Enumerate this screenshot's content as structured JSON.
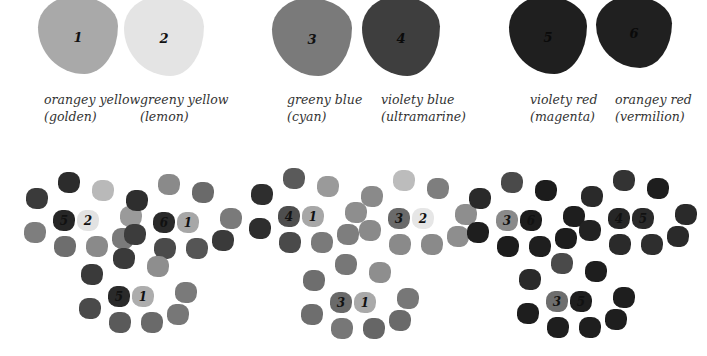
{
  "primaries": [
    {
      "num": "1",
      "name": "orangey yellow",
      "alt": "(golden)",
      "color": "#a9a9a9",
      "x": 38,
      "y": -4,
      "w": 80,
      "h": 78,
      "label_x": 44
    },
    {
      "num": "2",
      "name": "greeny yellow",
      "alt": "(lemon)",
      "color": "#e4e4e4",
      "x": 124,
      "y": -4,
      "w": 80,
      "h": 80,
      "label_x": 140
    },
    {
      "num": "3",
      "name": "greeny  blue",
      "alt": "(cyan)",
      "color": "#7a7a7a",
      "x": 272,
      "y": -2,
      "w": 80,
      "h": 78,
      "label_x": 287
    },
    {
      "num": "4",
      "name": "violety blue",
      "alt": "(ultramarine)",
      "color": "#3e3e3e",
      "x": 362,
      "y": -4,
      "w": 78,
      "h": 80,
      "label_x": 381
    },
    {
      "num": "5",
      "name": "violety red",
      "alt": "(magenta)",
      "color": "#1f1f1f",
      "x": 509,
      "y": -4,
      "w": 78,
      "h": 78,
      "label_x": 530
    },
    {
      "num": "6",
      "name": "orangey  red",
      "alt": "(vermilion)",
      "color": "#202020",
      "x": 596,
      "y": -4,
      "w": 76,
      "h": 72,
      "label_x": 615
    }
  ],
  "mixes": [
    {
      "id": "5-2",
      "cx": 75,
      "cy": 220,
      "a": "5",
      "b": "2",
      "a_color": "#262626",
      "b_color": "#e2e2e2",
      "ring": [
        "#3a3a3a",
        "#2c2c2c",
        "#b9b9b9",
        "#9a9a9a",
        "#7e7e7e",
        "#6e6e6e",
        "#8a8a8a",
        "#7a7a7a"
      ]
    },
    {
      "id": "6-1",
      "cx": 175,
      "cy": 222,
      "a": "6",
      "b": "1",
      "a_color": "#2a2a2a",
      "b_color": "#a7a7a7",
      "ring": [
        "#2e2e2e",
        "#8a8a8a",
        "#6a6a6a",
        "#7a7a7a",
        "#3c3c3c",
        "#4a4a4a",
        "#555555",
        "#3a3a3a"
      ]
    },
    {
      "id": "5-1",
      "cx": 130,
      "cy": 296,
      "a": "5",
      "b": "1",
      "a_color": "#2a2a2a",
      "b_color": "#adadad",
      "ring": [
        "#3a3a3a",
        "#3a3a3a",
        "#8e8e8e",
        "#7a7a7a",
        "#4a4a4a",
        "#5a5a5a",
        "#6a6a6a",
        "#777777"
      ]
    },
    {
      "id": "4-1",
      "cx": 300,
      "cy": 216,
      "a": "4",
      "b": "1",
      "a_color": "#4e4e4e",
      "b_color": "#a7a7a7",
      "ring": [
        "#2e2e2e",
        "#5a5a5a",
        "#9a9a9a",
        "#8e8e8e",
        "#2e2e2e",
        "#4a4a4a",
        "#7a7a7a",
        "#7e7e7e"
      ]
    },
    {
      "id": "3-2",
      "cx": 410,
      "cy": 218,
      "a": "3",
      "b": "2",
      "a_color": "#6a6a6a",
      "b_color": "#e6e6e6",
      "ring": [
        "#8a8a8a",
        "#bcbcbc",
        "#7e7e7e",
        "#8e8e8e",
        "#8a8a8a",
        "#8a8a8a",
        "#8a8a8a",
        "#8e8e8e"
      ]
    },
    {
      "id": "3-1",
      "cx": 352,
      "cy": 302,
      "a": "3",
      "b": "1",
      "a_color": "#6a6a6a",
      "b_color": "#a9a9a9",
      "ring": [
        "#6e6e6e",
        "#777777",
        "#8e8e8e",
        "#777777",
        "#6e6e6e",
        "#777777",
        "#666666",
        "#6a6a6a"
      ]
    },
    {
      "id": "3-6",
      "cx": 518,
      "cy": 220,
      "a": "3",
      "b": "6",
      "a_color": "#8a8a8a",
      "b_color": "#1c1c1c",
      "ring": [
        "#2a2a2a",
        "#4a4a4a",
        "#1c1c1c",
        "#1e1e1e",
        "#1e1e1e",
        "#1c1c1c",
        "#1e1e1e",
        "#1c1c1c"
      ]
    },
    {
      "id": "4-5",
      "cx": 630,
      "cy": 218,
      "a": "4",
      "b": "5",
      "a_color": "#262626",
      "b_color": "#2a2a2a",
      "ring": [
        "#2a2a2a",
        "#333333",
        "#1e1e1e",
        "#2a2a2a",
        "#222222",
        "#2a2a2a",
        "#2e2e2e",
        "#2a2a2a"
      ]
    },
    {
      "id": "3-5",
      "cx": 568,
      "cy": 301,
      "a": "3",
      "b": "5",
      "a_color": "#6e6e6e",
      "b_color": "#1e1e1e",
      "ring": [
        "#2a2a2a",
        "#4a4a4a",
        "#1e1e1e",
        "#1e1e1e",
        "#1e1e1e",
        "#1e1e1e",
        "#1e1e1e",
        "#1e1e1e"
      ]
    }
  ]
}
